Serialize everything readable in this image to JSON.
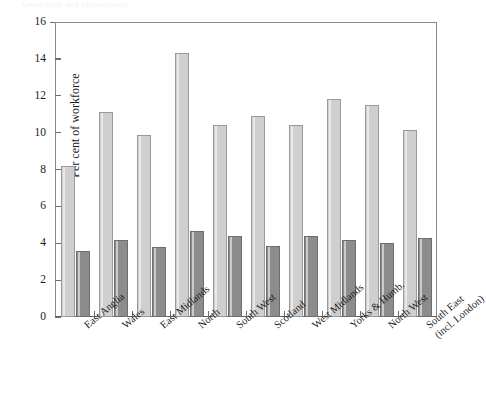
{
  "page_header": "Geography and employment",
  "chart_data": {
    "type": "bar",
    "title": "",
    "subtitle": "",
    "xlabel": "",
    "ylabel": "Per cent of workforce",
    "ylim": [
      0,
      16
    ],
    "ytick_labels": [
      "0",
      "2",
      "4",
      "6",
      "8",
      "10",
      "12",
      "14",
      "16"
    ],
    "ytick_values": [
      0,
      2,
      4,
      6,
      8,
      10,
      12,
      14,
      16
    ],
    "grid": false,
    "legend": false,
    "legend_position": "none",
    "categories": [
      "East Anglia",
      "Wales",
      "East Midlands",
      "North",
      "South West",
      "Scotland",
      "West Midlands",
      "Yorks & Humb.",
      "North West",
      "South East (incl. London)"
    ],
    "category_lines": [
      [
        "East Anglia",
        ""
      ],
      [
        "Wales",
        ""
      ],
      [
        "East Midlands",
        ""
      ],
      [
        "North",
        ""
      ],
      [
        "South West",
        ""
      ],
      [
        "Scotland",
        ""
      ],
      [
        "West Midlands",
        ""
      ],
      [
        "Yorks & Humb.",
        ""
      ],
      [
        "North West",
        ""
      ],
      [
        "South East",
        "(incl. London)"
      ]
    ],
    "series": [
      {
        "name": "series-1",
        "color": "#cfcfcf",
        "values": [
          8.2,
          11.1,
          9.85,
          14.3,
          10.4,
          10.9,
          10.4,
          11.8,
          11.5,
          10.15
        ]
      },
      {
        "name": "series-2",
        "color": "#8c8c8c",
        "values": [
          3.6,
          4.2,
          3.8,
          4.65,
          4.4,
          3.85,
          4.4,
          4.2,
          4.0,
          4.3
        ]
      }
    ]
  }
}
